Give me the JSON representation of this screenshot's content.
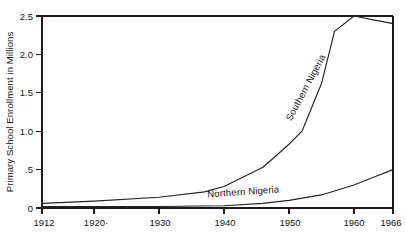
{
  "chart_data": {
    "type": "line",
    "title": "",
    "xlabel": "",
    "ylabel": "Primary School Enrollment in Millions",
    "xlim": [
      1912,
      1966
    ],
    "ylim": [
      0,
      2.5
    ],
    "grid": false,
    "legend_position": "inline-labels",
    "x_tick_labels": [
      "1912",
      "1920·",
      "1930",
      "1940",
      "1950",
      "1960",
      "1966"
    ],
    "x_tick_values": [
      1912,
      1920,
      1930,
      1940,
      1950,
      1960,
      1966
    ],
    "y_tick_labels": [
      "0",
      ".5",
      "1.0",
      "1.5",
      "2.0",
      "2.5"
    ],
    "y_tick_values": [
      0,
      0.5,
      1.0,
      1.5,
      2.0,
      2.5
    ],
    "series": [
      {
        "name": "Southern Nigeria",
        "label_text": "Southern Nigeria",
        "color": "#242424",
        "x": [
          1912,
          1920,
          1930,
          1937,
          1940,
          1946,
          1950,
          1952,
          1955,
          1957,
          1960,
          1963,
          1966
        ],
        "values": [
          0.06,
          0.09,
          0.14,
          0.21,
          0.28,
          0.53,
          0.83,
          1.0,
          1.62,
          2.3,
          2.5,
          2.45,
          2.4
        ]
      },
      {
        "name": "Northern Nigeria",
        "label_text": "Northern Nigeria",
        "color": "#242424",
        "x": [
          1912,
          1920,
          1930,
          1940,
          1946,
          1950,
          1955,
          1960,
          1963,
          1966
        ],
        "values": [
          0.02,
          0.02,
          0.02,
          0.03,
          0.06,
          0.1,
          0.17,
          0.3,
          0.4,
          0.5
        ]
      }
    ],
    "annotations": [
      {
        "text": "Southern Nigeria",
        "x": 1953,
        "y": 1.55,
        "rotation": -62
      },
      {
        "text": "Northern Nigeria",
        "x": 1943,
        "y": 0.17,
        "rotation": -4
      }
    ]
  },
  "colors": {
    "background": "#ffffff",
    "axis": "#1c1c1c",
    "line": "#242424",
    "text": "#141414"
  }
}
